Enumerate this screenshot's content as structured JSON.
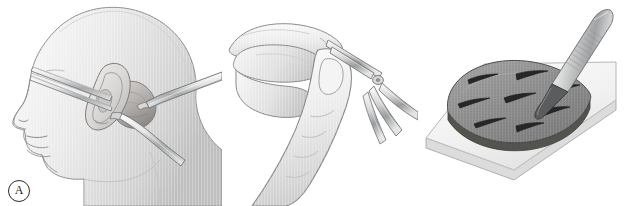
{
  "figure": {
    "style": "grayscale medical line-and-tone illustration",
    "background_color": "#ffffff",
    "width": 626,
    "height": 206,
    "panel_count": 3
  },
  "panels": [
    {
      "id": "A",
      "label": "A",
      "name": "panel-a-postauricular-exposure",
      "caption": "Lateral view of head with ear retracted anteriorly; postauricular incision exposed with retractors and elevator",
      "elements": [
        "head-profile",
        "ear-auricle",
        "postauricular-surgical-site",
        "upper-elevator-instrument",
        "lateral-retractor-instrument",
        "lower-retractor-instrument"
      ]
    },
    {
      "id": "B",
      "label": "B",
      "name": "panel-b-instrument-in-hand",
      "caption": "Surgeon's hand holding curved scissors between thumb and index finger",
      "elements": [
        "hand",
        "index-finger",
        "thumb",
        "scissors-blades",
        "scissors-pivot-screw",
        "scissors-handles"
      ]
    },
    {
      "id": "C",
      "label": "C",
      "name": "panel-c-graft-meshing",
      "caption": "Scalpel creating fenestration slits in a graft resting on a cutting board",
      "elements": [
        "cutting-board",
        "graft",
        "graft-slits",
        "scalpel-handle",
        "scalpel-blade"
      ],
      "graft_slit_count": 7
    }
  ],
  "colors": {
    "background": "#ffffff",
    "outline": "#6f7274",
    "outline_dark": "#3d3f41",
    "skin_light": "#f2f2f2",
    "skin_mid": "#dedede",
    "skin_shadow": "#c3c3c3",
    "metal_light": "#f4f4f4",
    "metal_mid": "#cfcfcf",
    "metal_dark": "#8e9092",
    "tissue_mid": "#c9c6c4",
    "tissue_dark": "#9b9896",
    "graft_fill": "#8d8d8d",
    "graft_edge": "#4a4a4a",
    "slit": "#2a2a2a",
    "board_fill": "#f0f0f0",
    "board_edge": "#b9b9b9",
    "label_text": "#1c1c1c",
    "label_ring": "#2b2b2b"
  }
}
